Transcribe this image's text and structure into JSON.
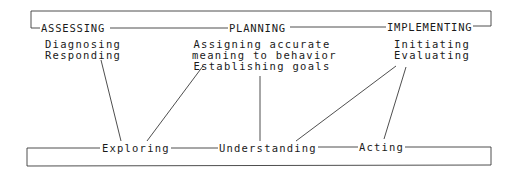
{
  "diagram": {
    "phases": [
      {
        "label": "ASSESSING"
      },
      {
        "label": "PLANNING"
      },
      {
        "label": "IMPLEMENTING"
      }
    ],
    "phase_activities": [
      {
        "lines": [
          "Diagnosing",
          "Responding"
        ]
      },
      {
        "lines": [
          "Assigning accurate",
          "meaning to behavior",
          "Establishing goals"
        ]
      },
      {
        "lines": [
          "Initiating",
          "Evaluating"
        ]
      }
    ],
    "process_steps": [
      {
        "label": "Exploring"
      },
      {
        "label": "Understanding"
      },
      {
        "label": "Acting"
      }
    ],
    "connections": [
      {
        "from": "Responding",
        "to": "Exploring"
      },
      {
        "from": "Establishing goals",
        "to": "Exploring"
      },
      {
        "from": "Establishing goals",
        "to": "Understanding"
      },
      {
        "from": "Evaluating",
        "to": "Understanding"
      },
      {
        "from": "Evaluating",
        "to": "Acting"
      }
    ],
    "colors": {
      "line": "#3a3a3a",
      "text": "#1a1a1a",
      "background": "#ffffff"
    }
  }
}
